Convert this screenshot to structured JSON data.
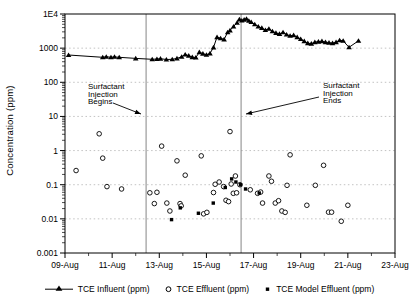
{
  "chart_data": {
    "type": "line+scatter",
    "title": "",
    "xlabel": "",
    "ylabel": "Concentration (ppm)",
    "y_scale": "log",
    "ylim": [
      0.001,
      10000
    ],
    "y_tick_labels": [
      "1E4",
      "1000",
      "100",
      "10",
      "1",
      "0.1",
      "0.01",
      "0.001"
    ],
    "y_tick_values": [
      10000,
      1000,
      100,
      10,
      1,
      0.1,
      0.01,
      0.001
    ],
    "grid_decade_values": [
      1000,
      100,
      10,
      1,
      0.1,
      0.01
    ],
    "x_tick_labels": [
      "09-Aug",
      "11-Aug",
      "13-Aug",
      "15-Aug",
      "17-Aug",
      "19-Aug",
      "21-Aug",
      "23-Aug"
    ],
    "x_tick_days": [
      9,
      11,
      13,
      15,
      17,
      19,
      21,
      23
    ],
    "x_minor_days": [
      10,
      12,
      14,
      16,
      18,
      20,
      22
    ],
    "xlim_days": [
      9,
      23
    ],
    "grid_on": true,
    "legend_position": "bottom",
    "series": [
      {
        "name": "TCE Influent (ppm)",
        "marker": "triangle-filled",
        "line": true,
        "points": [
          [
            9.15,
            630
          ],
          [
            10.6,
            540
          ],
          [
            10.75,
            560
          ],
          [
            10.95,
            540
          ],
          [
            11.1,
            555
          ],
          [
            11.3,
            540
          ],
          [
            12.0,
            500
          ],
          [
            12.7,
            470
          ],
          [
            12.9,
            480
          ],
          [
            13.05,
            490
          ],
          [
            13.3,
            465
          ],
          [
            13.55,
            470
          ],
          [
            13.75,
            500
          ],
          [
            13.95,
            560
          ],
          [
            14.1,
            650
          ],
          [
            14.25,
            600
          ],
          [
            14.4,
            545
          ],
          [
            14.55,
            530
          ],
          [
            14.7,
            760
          ],
          [
            14.85,
            690
          ],
          [
            15.0,
            640
          ],
          [
            15.15,
            700
          ],
          [
            15.3,
            1050
          ],
          [
            15.45,
            2100
          ],
          [
            15.6,
            1950
          ],
          [
            15.75,
            1800
          ],
          [
            15.9,
            2900
          ],
          [
            16.0,
            3300
          ],
          [
            16.15,
            4300
          ],
          [
            16.3,
            5500
          ],
          [
            16.4,
            7000
          ],
          [
            16.5,
            6400
          ],
          [
            16.6,
            6800
          ],
          [
            16.7,
            7200
          ],
          [
            16.8,
            6300
          ],
          [
            16.9,
            5800
          ],
          [
            17.05,
            5000
          ],
          [
            17.2,
            4300
          ],
          [
            17.35,
            3900
          ],
          [
            17.5,
            3400
          ],
          [
            17.65,
            3700
          ],
          [
            17.8,
            3100
          ],
          [
            17.95,
            2800
          ],
          [
            18.1,
            2600
          ],
          [
            18.25,
            2900
          ],
          [
            18.4,
            2500
          ],
          [
            18.55,
            2300
          ],
          [
            18.7,
            2400
          ],
          [
            18.85,
            2100
          ],
          [
            19.0,
            1850
          ],
          [
            19.15,
            1600
          ],
          [
            19.3,
            1400
          ],
          [
            19.45,
            1350
          ],
          [
            19.6,
            1500
          ],
          [
            19.75,
            1550
          ],
          [
            19.9,
            1600
          ],
          [
            20.05,
            1500
          ],
          [
            20.2,
            1450
          ],
          [
            20.35,
            1400
          ],
          [
            20.5,
            1500
          ],
          [
            20.65,
            1700
          ],
          [
            20.8,
            1640
          ],
          [
            21.05,
            1060
          ],
          [
            21.45,
            1640
          ]
        ]
      },
      {
        "name": "TCE Effluent (ppm)",
        "marker": "circle-open",
        "line": false,
        "points": [
          [
            9.47,
            0.26
          ],
          [
            10.45,
            3.1
          ],
          [
            10.6,
            0.6
          ],
          [
            10.78,
            0.088
          ],
          [
            11.4,
            0.075
          ],
          [
            12.6,
            0.058
          ],
          [
            12.79,
            0.028
          ],
          [
            12.9,
            0.06
          ],
          [
            13.1,
            1.35
          ],
          [
            13.32,
            0.029
          ],
          [
            13.45,
            0.017
          ],
          [
            13.75,
            0.5
          ],
          [
            13.88,
            0.028
          ],
          [
            13.93,
            0.024
          ],
          [
            14.1,
            0.19
          ],
          [
            14.78,
            0.7
          ],
          [
            14.88,
            0.014
          ],
          [
            15.02,
            0.0155
          ],
          [
            15.3,
            0.059
          ],
          [
            15.37,
            0.103
          ],
          [
            15.54,
            0.12
          ],
          [
            15.73,
            0.088
          ],
          [
            15.83,
            0.035
          ],
          [
            15.94,
            0.032
          ],
          [
            16.0,
            3.6
          ],
          [
            16.05,
            0.105
          ],
          [
            16.14,
            0.056
          ],
          [
            16.23,
            0.18
          ],
          [
            16.28,
            0.058
          ],
          [
            16.42,
            0.1
          ],
          [
            16.86,
            0.071
          ],
          [
            17.17,
            0.056
          ],
          [
            17.3,
            0.061
          ],
          [
            17.38,
            0.029
          ],
          [
            17.65,
            0.18
          ],
          [
            17.76,
            0.126
          ],
          [
            17.92,
            0.029
          ],
          [
            18.06,
            0.034
          ],
          [
            18.2,
            0.017
          ],
          [
            18.34,
            0.0155
          ],
          [
            18.42,
            0.096
          ],
          [
            18.55,
            0.75
          ],
          [
            19.26,
            0.025
          ],
          [
            19.62,
            0.096
          ],
          [
            19.97,
            0.37
          ],
          [
            20.18,
            0.0157
          ],
          [
            20.31,
            0.0157
          ],
          [
            20.72,
            0.0085
          ],
          [
            21.0,
            0.025
          ]
        ]
      },
      {
        "name": "TCE Model Effluent (ppm)",
        "marker": "square-filled",
        "line": false,
        "points": [
          [
            13.52,
            0.0095
          ],
          [
            13.89,
            0.021
          ],
          [
            14.66,
            0.0146
          ],
          [
            15.29,
            0.029
          ],
          [
            15.8,
            0.083
          ],
          [
            16.07,
            0.148
          ],
          [
            16.25,
            0.12
          ],
          [
            16.45,
            0.1
          ],
          [
            16.66,
            0.075
          ],
          [
            17.24,
            0.057
          ]
        ]
      }
    ],
    "event_lines": [
      {
        "day": 12.44,
        "annotation_lines": [
          "Surfactant",
          "Injection",
          "Begins"
        ],
        "text_x": 88,
        "text_y": 89,
        "text_anchor": "start",
        "arrow_from": [
          113,
          103
        ],
        "arrow_to": [
          141,
          114
        ]
      },
      {
        "day": 16.47,
        "annotation_lines": [
          "Surfactant",
          "Injection",
          "Ends"
        ],
        "text_x": 323,
        "text_y": 88,
        "text_anchor": "start",
        "arrow_from": [
          319,
          97
        ],
        "arrow_to": [
          246,
          114
        ]
      }
    ]
  },
  "legend": {
    "items": [
      {
        "label": "TCE Influent (ppm)",
        "marker": "triangle-line"
      },
      {
        "label": "TCE Effluent (ppm)",
        "marker": "circle-open"
      },
      {
        "label": "TCE Model Effluent (ppm)",
        "marker": "square-filled"
      }
    ]
  },
  "colors": {
    "foreground": "#000000",
    "grid": "#a8a8a8",
    "event_line": "#777777",
    "background": "#ffffff"
  }
}
